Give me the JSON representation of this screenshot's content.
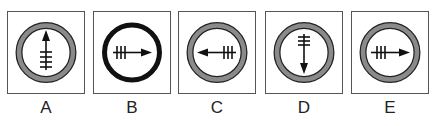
{
  "figure": {
    "type": "multiple-choice-options",
    "options": [
      {
        "label": "A",
        "ring": "gray-thick-outlined",
        "arrow_direction": "up",
        "tick_marks": 4,
        "tick_side": "tail"
      },
      {
        "label": "B",
        "ring": "black-thick",
        "arrow_direction": "right",
        "tick_marks": 3,
        "tick_side": "tail"
      },
      {
        "label": "C",
        "ring": "gray-thick-outlined",
        "arrow_direction": "left",
        "tick_marks": 3,
        "tick_side": "tail"
      },
      {
        "label": "D",
        "ring": "gray-thick-outlined",
        "arrow_direction": "down",
        "tick_marks": 3,
        "tick_side": "tail"
      },
      {
        "label": "E",
        "ring": "gray-thick-outlined",
        "arrow_direction": "right",
        "tick_marks": 3,
        "tick_side": "tail"
      }
    ]
  },
  "colors": {
    "ring_gray": "#8a8a8a",
    "ring_outline": "#222222",
    "ring_black": "#111111",
    "arrow": "#111111",
    "box_border": "#555555"
  }
}
